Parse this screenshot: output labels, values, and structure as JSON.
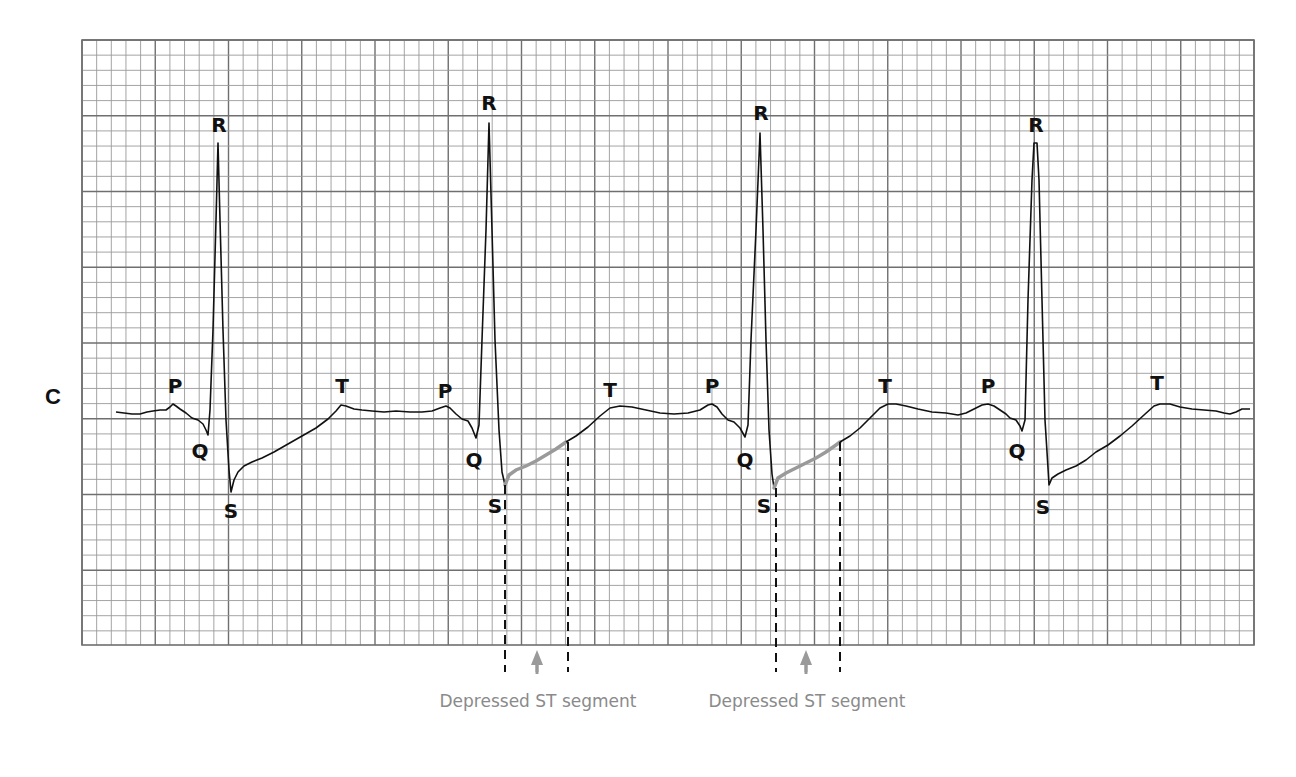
{
  "lead_label": "C",
  "grid": {
    "left": 82,
    "top": 40,
    "right": 1254,
    "bottom": 645,
    "minor_x": 14.65,
    "minor_y": 15.15,
    "major_every": 5,
    "line_color": "#9a9a9a",
    "major_color": "#6f6f6f"
  },
  "wave_labels": [
    {
      "text": "P",
      "x": 175,
      "y": 393
    },
    {
      "text": "R",
      "x": 219,
      "y": 132
    },
    {
      "text": "Q",
      "x": 200,
      "y": 458
    },
    {
      "text": "S",
      "x": 231,
      "y": 518
    },
    {
      "text": "T",
      "x": 342,
      "y": 393
    },
    {
      "text": "P",
      "x": 445,
      "y": 398
    },
    {
      "text": "R",
      "x": 489,
      "y": 110
    },
    {
      "text": "Q",
      "x": 474,
      "y": 467
    },
    {
      "text": "S",
      "x": 495,
      "y": 513
    },
    {
      "text": "T",
      "x": 610,
      "y": 397
    },
    {
      "text": "P",
      "x": 712,
      "y": 393
    },
    {
      "text": "R",
      "x": 761,
      "y": 120
    },
    {
      "text": "Q",
      "x": 745,
      "y": 467
    },
    {
      "text": "S",
      "x": 764,
      "y": 513
    },
    {
      "text": "T",
      "x": 885,
      "y": 393
    },
    {
      "text": "P",
      "x": 988,
      "y": 393
    },
    {
      "text": "R",
      "x": 1036,
      "y": 132
    },
    {
      "text": "Q",
      "x": 1017,
      "y": 458
    },
    {
      "text": "S",
      "x": 1043,
      "y": 514
    },
    {
      "text": "T",
      "x": 1157,
      "y": 390
    }
  ],
  "annotations": [
    {
      "text": "Depressed ST segment",
      "x": 538,
      "y": 707,
      "arrow_x": 537,
      "dash_left": 505,
      "dash_right": 568
    },
    {
      "text": "Depressed ST segment",
      "x": 807,
      "y": 707,
      "arrow_x": 806,
      "dash_left": 776,
      "dash_right": 840
    }
  ],
  "colors": {
    "trace": "#111111",
    "st_highlight": "#9a9a9a",
    "caption": "#8a8a8a"
  }
}
